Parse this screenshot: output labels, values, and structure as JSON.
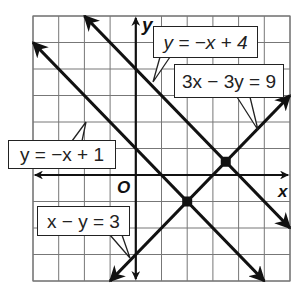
{
  "graph": {
    "x_range": [
      -4,
      6
    ],
    "y_range": [
      -4,
      6
    ],
    "grid_step": 1,
    "origin_label": "O",
    "x_axis_label": "x",
    "y_axis_label": "y",
    "colors": {
      "line": "#111111",
      "grid": "#777777",
      "background": "#ffffff"
    }
  },
  "lines": [
    {
      "equation": "y = −x + 4",
      "from": [
        -2,
        6
      ],
      "to": [
        6,
        -2
      ]
    },
    {
      "equation": "y = −x + 1",
      "from": [
        -4,
        5
      ],
      "to": [
        5,
        -4
      ]
    },
    {
      "equation": "3x − 3y = 9",
      "from": [
        -1,
        -4
      ],
      "to": [
        6,
        3
      ]
    },
    {
      "equation": "x − y = 3",
      "from": [
        -1,
        -4
      ],
      "to": [
        6,
        3
      ]
    }
  ],
  "intersections": [
    {
      "point": [
        3.5,
        0.5
      ],
      "lines": [
        "y = −x + 4",
        "3x − 3y = 9"
      ]
    },
    {
      "point": [
        2,
        -1
      ],
      "lines": [
        "y = −x + 1",
        "x − y = 3"
      ]
    }
  ],
  "labels": {
    "top": "y = −x + 4",
    "right": "3x − 3y = 9",
    "left": "y = −x + 1",
    "bottom": "x − y = 3"
  }
}
